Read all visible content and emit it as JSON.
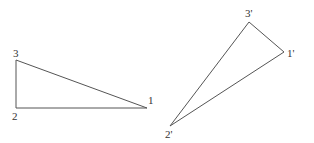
{
  "diagram": {
    "stroke_color": "#555555",
    "triangles": [
      {
        "name": "original",
        "vertices": [
          {
            "label": "1",
            "x": 147,
            "y": 108
          },
          {
            "label": "2",
            "x": 16,
            "y": 108
          },
          {
            "label": "3",
            "x": 16,
            "y": 60
          }
        ]
      },
      {
        "name": "transformed",
        "vertices": [
          {
            "label": "1'",
            "x": 284,
            "y": 52
          },
          {
            "label": "2'",
            "x": 170,
            "y": 126
          },
          {
            "label": "3'",
            "x": 249,
            "y": 22
          }
        ]
      }
    ]
  }
}
